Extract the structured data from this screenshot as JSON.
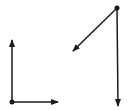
{
  "diagram": {
    "stroke_color": "#1a1a1a",
    "background": "#ffffff",
    "groups": [
      {
        "name": "left-axes",
        "origin": {
          "x": 12,
          "y": 102
        },
        "vectors": [
          {
            "name": "vertical-up",
            "from": {
              "x": 12,
              "y": 102
            },
            "to": {
              "x": 12,
              "y": 40
            }
          },
          {
            "name": "horizontal-right",
            "from": {
              "x": 12,
              "y": 102
            },
            "to": {
              "x": 58,
              "y": 102
            }
          }
        ]
      },
      {
        "name": "right-vectors",
        "origin": {
          "x": 117,
          "y": 8
        },
        "vectors": [
          {
            "name": "diagonal-down-left",
            "from": {
              "x": 117,
              "y": 8
            },
            "to": {
              "x": 73,
              "y": 51
            }
          },
          {
            "name": "vertical-down",
            "from": {
              "x": 117,
              "y": 8
            },
            "to": {
              "x": 118,
              "y": 106
            }
          }
        ]
      }
    ]
  }
}
